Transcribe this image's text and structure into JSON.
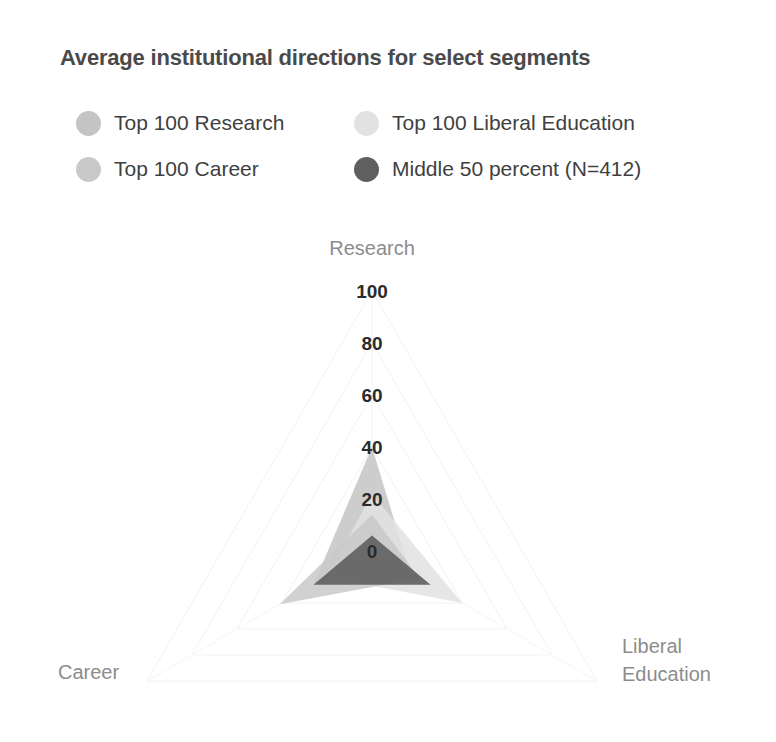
{
  "chart_title": "Average institutional directions for select segments",
  "legend": {
    "items": [
      {
        "label": "Top 100 Research",
        "color": "#c4c4c4"
      },
      {
        "label": "Top 100 Liberal Education",
        "color": "#e2e2e2"
      },
      {
        "label": "Top 100 Career",
        "color": "#c9c9c9"
      },
      {
        "label": "Middle 50 percent (N=412)",
        "color": "#5f5f5f"
      }
    ]
  },
  "chart_data": {
    "type": "radar",
    "title": "Average institutional directions for select segments",
    "categories": [
      "Research",
      "Liberal Education",
      "Career"
    ],
    "axis_labels": {
      "research": "Research",
      "liberal_education_line1": "Liberal",
      "liberal_education_line2": "Education",
      "career": "Career"
    },
    "tick_values": [
      0,
      20,
      40,
      60,
      80,
      100
    ],
    "tick_labels": [
      "0",
      "20",
      "40",
      "60",
      "80",
      "100"
    ],
    "rlim": [
      0,
      100
    ],
    "grid": true,
    "legend_position": "top",
    "series": [
      {
        "name": "Top 100 Research",
        "color": "#c4c4c4",
        "opacity": 0.85,
        "values": [
          40,
          17,
          26
        ]
      },
      {
        "name": "Top 100 Liberal Education",
        "color": "#e2e2e2",
        "opacity": 0.85,
        "values": [
          22,
          40,
          20
        ]
      },
      {
        "name": "Top 100 Career",
        "color": "#c9c9c9",
        "opacity": 0.85,
        "values": [
          14,
          21,
          41
        ]
      },
      {
        "name": "Middle 50 percent (N=412)",
        "color": "#5f5f5f",
        "opacity": 0.9,
        "values": [
          6,
          26,
          26
        ]
      }
    ]
  }
}
